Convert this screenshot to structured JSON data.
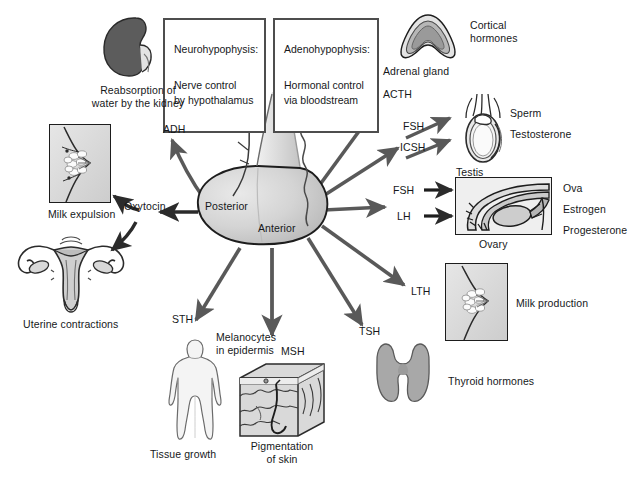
{
  "diagram": {
    "background": "#ffffff",
    "ink": "#16181a",
    "arrow_color": "#595959"
  },
  "boxes": {
    "neurohypophysis": {
      "heading": "Neurohypophysis:",
      "body": "Nerve control\nby hypothalamus"
    },
    "adenohypophysis": {
      "heading": "Adenohypophysis:",
      "body": "Hormonal control\nvia bloodstream"
    }
  },
  "gland": {
    "posterior_label": "Posterior",
    "anterior_label": "Anterior"
  },
  "hormones": {
    "adh": "ADH",
    "oxytocin": "Oxytocin",
    "acth": "ACTH",
    "fsh_testis": "FSH",
    "icsh": "ICSH",
    "fsh_ovary": "FSH",
    "lh": "LH",
    "lth": "LTH",
    "tsh": "TSH",
    "msh": "MSH",
    "sth": "STH"
  },
  "targets": {
    "kidney_caption": "Reabsorption of\nwater by the kidney",
    "milk_expulsion": "Milk expulsion",
    "uterine_contractions": "Uterine contractions",
    "adrenal_gland": "Adrenal gland",
    "cortical_hormones": "Cortical\nhormones",
    "testis": "Testis",
    "sperm": "Sperm",
    "testosterone": "Testosterone",
    "ovary": "Ovary",
    "ova": "Ova",
    "estrogen": "Estrogen",
    "progesterone": "Progesterone",
    "milk_production": "Milk production",
    "thyroid_hormones": "Thyroid hormones",
    "melanocytes": "Melanocytes\nin epidermis",
    "pigmentation": "Pigmentation\nof skin",
    "tissue_growth": "Tissue growth"
  }
}
